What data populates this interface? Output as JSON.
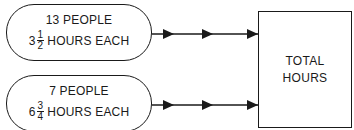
{
  "diagram": {
    "groups": [
      {
        "people_label": "13 PEOPLE",
        "hours_whole": "3",
        "hours_numerator": "1",
        "hours_denominator": "2",
        "hours_suffix": "HOURS EACH"
      },
      {
        "people_label": "7 PEOPLE",
        "hours_whole": "6",
        "hours_numerator": "3",
        "hours_denominator": "4",
        "hours_suffix": "HOURS EACH"
      }
    ],
    "total_box": {
      "line1": "TOTAL",
      "line2": "HOURS"
    },
    "colors": {
      "stroke": "#1a1a1a",
      "background": "#ffffff"
    }
  }
}
